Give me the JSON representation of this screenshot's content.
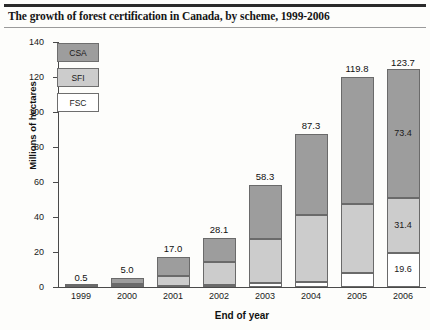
{
  "title": "The growth of forest certification in Canada, by scheme, 1999-2006",
  "legend": {
    "items": [
      {
        "label": "CSA",
        "color": "#9d9d9d"
      },
      {
        "label": "SFI",
        "color": "#cccccc"
      },
      {
        "label": "FSC",
        "color": "#ffffff"
      }
    ]
  },
  "chart_data": {
    "type": "bar",
    "subtype": "stacked",
    "title": "The growth of forest certification in Canada, by scheme, 1999-2006",
    "xlabel": "End of year",
    "ylabel": "Millions of hectares",
    "categories": [
      "1999",
      "2000",
      "2001",
      "2002",
      "2003",
      "2004",
      "2005",
      "2006"
    ],
    "ylim": [
      0,
      140
    ],
    "yticks": [
      0,
      20,
      40,
      60,
      80,
      100,
      120,
      140
    ],
    "grid": false,
    "legend_position": "top-left inside plot",
    "series": [
      {
        "name": "FSC",
        "color": "#ffffff",
        "values": [
          0.1,
          0.3,
          0.8,
          1.3,
          2.1,
          3.0,
          7.9,
          19.6
        ]
      },
      {
        "name": "SFI",
        "color": "#cccccc",
        "values": [
          0.2,
          1.4,
          5.6,
          13.0,
          25.6,
          38.2,
          39.4,
          31.4
        ]
      },
      {
        "name": "CSA",
        "color": "#9d9d9d",
        "values": [
          0.2,
          3.3,
          10.6,
          13.8,
          30.6,
          46.1,
          72.5,
          73.4
        ]
      }
    ],
    "totals": [
      0.5,
      5.0,
      17.0,
      28.1,
      58.3,
      87.3,
      119.8,
      123.7
    ],
    "total_labels": [
      "0.5",
      "5.0",
      "17.0",
      "28.1",
      "58.3",
      "87.3",
      "119.8",
      "123.7"
    ],
    "segment_labels_2006": {
      "CSA": "73.4",
      "SFI": "31.4",
      "FSC": "19.6"
    },
    "annotations": [
      {
        "year": "2006",
        "series": "CSA",
        "text": "73.4"
      },
      {
        "year": "2006",
        "series": "SFI",
        "text": "31.4"
      },
      {
        "year": "2006",
        "series": "FSC",
        "text": "19.6"
      }
    ]
  }
}
